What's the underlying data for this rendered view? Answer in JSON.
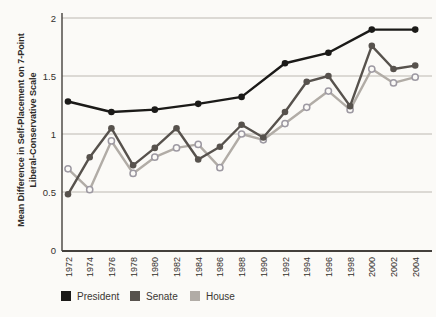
{
  "chart_data": {
    "type": "line",
    "title": "",
    "xlabel": "",
    "ylabel": "Mean Difference in Self-Placement on 7-Point Liberal-Conservative Scale",
    "ylabel_lines": [
      "Mean Difference in Self-Placement on 7-Point",
      "Liberal-Conservative Scale"
    ],
    "ylim": [
      0,
      2
    ],
    "yticks": [
      0,
      0.5,
      1,
      1.5,
      2
    ],
    "ytick_labels": [
      "0",
      "0.5",
      "1",
      "1.5",
      "2"
    ],
    "x_tick_labels": [
      "1972",
      "1974",
      "1976",
      "1978",
      "1980",
      "1982",
      "1984",
      "1986",
      "1988",
      "1990",
      "1992",
      "1994",
      "1996",
      "1998",
      "2000",
      "2002",
      "2004"
    ],
    "grid": true,
    "legend_position": "bottom",
    "colors": {
      "president": "#1b1a18",
      "senate": "#57524d",
      "house": "#b1aca6",
      "gridline": "#bcb8b1",
      "axis": "#44403c",
      "tick_text": "#332f2b"
    },
    "series": [
      {
        "name": "President",
        "color": "#1b1a18",
        "marker": "filled",
        "x": [
          1972,
          1976,
          1980,
          1984,
          1988,
          1992,
          1996,
          2000,
          2004
        ],
        "values": [
          1.28,
          1.19,
          1.21,
          1.26,
          1.32,
          1.61,
          1.7,
          1.9,
          1.9
        ]
      },
      {
        "name": "Senate",
        "color": "#57524d",
        "marker": "filled",
        "x": [
          1972,
          1974,
          1976,
          1978,
          1980,
          1982,
          1984,
          1986,
          1988,
          1990,
          1992,
          1994,
          1996,
          1998,
          2000,
          2002,
          2004
        ],
        "values": [
          0.48,
          0.8,
          1.05,
          0.73,
          0.88,
          1.05,
          0.78,
          0.89,
          1.08,
          0.97,
          1.19,
          1.45,
          1.5,
          1.24,
          1.76,
          1.56,
          1.59
        ]
      },
      {
        "name": "House",
        "color": "#b1aca6",
        "marker": "open",
        "x": [
          1972,
          1974,
          1976,
          1978,
          1980,
          1982,
          1984,
          1986,
          1988,
          1990,
          1992,
          1994,
          1996,
          1998,
          2000,
          2002,
          2004
        ],
        "values": [
          0.7,
          0.52,
          0.94,
          0.66,
          0.8,
          0.88,
          0.91,
          0.71,
          1.0,
          0.95,
          1.09,
          1.23,
          1.37,
          1.21,
          1.56,
          1.44,
          1.49
        ]
      }
    ]
  },
  "legend": {
    "president_label": "President",
    "senate_label": "Senate",
    "house_label": "House"
  }
}
